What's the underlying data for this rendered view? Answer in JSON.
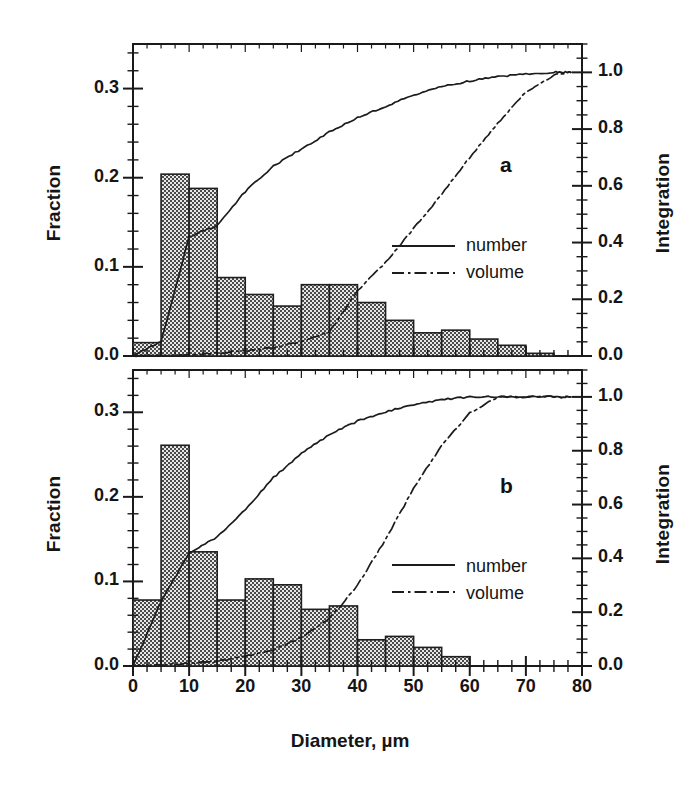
{
  "figure": {
    "xlabel": "Diameter, µm",
    "ylabel_left": "Fraction",
    "ylabel_right": "Integration"
  },
  "axes": {
    "x_ticks": [
      "0",
      "10",
      "20",
      "30",
      "40",
      "50",
      "60",
      "70",
      "80"
    ],
    "y_left_ticks": [
      "0.0",
      "0.1",
      "0.2",
      "0.3"
    ],
    "y_right_ticks": [
      "0.0",
      "0.2",
      "0.4",
      "0.6",
      "0.8",
      "1.0"
    ]
  },
  "legend": {
    "number_label": "number",
    "volume_label": "volume"
  },
  "panels": {
    "a": {
      "letter": "a"
    },
    "b": {
      "letter": "b"
    }
  },
  "chart_data": [
    {
      "type": "bar",
      "panel": "a",
      "title": "",
      "xlabel": "Diameter, µm",
      "ylabel": "Fraction",
      "ylabel_secondary": "Integration",
      "xlim": [
        0,
        80
      ],
      "ylim": [
        0.0,
        0.35
      ],
      "ylim_secondary": [
        0.0,
        1.1
      ],
      "grid": false,
      "legend_position": "center-right",
      "bin_width": 5,
      "bin_edges": [
        0,
        5,
        10,
        15,
        20,
        25,
        30,
        35,
        40,
        45,
        50,
        55,
        60,
        65,
        70,
        75,
        80
      ],
      "categories": [
        "0-5",
        "5-10",
        "10-15",
        "15-20",
        "20-25",
        "25-30",
        "30-35",
        "35-40",
        "40-45",
        "45-50",
        "50-55",
        "55-60",
        "60-65",
        "65-70",
        "70-75",
        "75-80"
      ],
      "values": [
        0.015,
        0.204,
        0.188,
        0.088,
        0.069,
        0.056,
        0.08,
        0.08,
        0.06,
        0.04,
        0.026,
        0.029,
        0.019,
        0.012,
        0.003,
        0.0
      ],
      "series": [
        {
          "name": "number",
          "style": "solid",
          "axis": "secondary",
          "x": [
            0,
            5,
            10,
            15,
            20,
            25,
            30,
            35,
            40,
            45,
            50,
            55,
            60,
            65,
            70,
            75,
            78
          ],
          "values": [
            0.0,
            0.05,
            0.42,
            0.46,
            0.58,
            0.67,
            0.73,
            0.79,
            0.84,
            0.88,
            0.92,
            0.95,
            0.97,
            0.985,
            0.995,
            1.0,
            1.0
          ]
        },
        {
          "name": "volume",
          "style": "dash-dot",
          "axis": "secondary",
          "x": [
            0,
            5,
            10,
            15,
            20,
            25,
            30,
            35,
            40,
            45,
            50,
            55,
            60,
            65,
            70,
            75,
            78
          ],
          "values": [
            0.0,
            0.002,
            0.005,
            0.01,
            0.018,
            0.03,
            0.05,
            0.085,
            0.23,
            0.33,
            0.45,
            0.57,
            0.7,
            0.82,
            0.93,
            0.99,
            1.0
          ]
        }
      ]
    },
    {
      "type": "bar",
      "panel": "b",
      "title": "",
      "xlabel": "Diameter, µm",
      "ylabel": "Fraction",
      "ylabel_secondary": "Integration",
      "xlim": [
        0,
        80
      ],
      "ylim": [
        0.0,
        0.35
      ],
      "ylim_secondary": [
        0.0,
        1.1
      ],
      "grid": false,
      "legend_position": "center-right",
      "bin_width": 5,
      "bin_edges": [
        0,
        5,
        10,
        15,
        20,
        25,
        30,
        35,
        40,
        45,
        50,
        55,
        60,
        65,
        70,
        75,
        80
      ],
      "categories": [
        "0-5",
        "5-10",
        "10-15",
        "15-20",
        "20-25",
        "25-30",
        "30-35",
        "35-40",
        "40-45",
        "45-50",
        "50-55",
        "55-60",
        "60-65",
        "65-70",
        "70-75",
        "75-80"
      ],
      "values": [
        0.078,
        0.261,
        0.135,
        0.078,
        0.103,
        0.096,
        0.067,
        0.071,
        0.031,
        0.035,
        0.022,
        0.011,
        0.0,
        0.0,
        0.0,
        0.0
      ],
      "series": [
        {
          "name": "number",
          "style": "solid",
          "axis": "secondary",
          "x": [
            0,
            5,
            10,
            15,
            20,
            25,
            30,
            35,
            40,
            45,
            50,
            55,
            60,
            65,
            70,
            75,
            78
          ],
          "values": [
            0.0,
            0.24,
            0.42,
            0.48,
            0.58,
            0.7,
            0.79,
            0.86,
            0.91,
            0.945,
            0.97,
            0.99,
            1.0,
            1.0,
            1.0,
            1.0,
            1.0
          ]
        },
        {
          "name": "volume",
          "style": "dash-dot",
          "axis": "secondary",
          "x": [
            0,
            5,
            10,
            15,
            20,
            25,
            30,
            35,
            40,
            45,
            50,
            55,
            60,
            65,
            70,
            75,
            78
          ],
          "values": [
            0.0,
            0.004,
            0.01,
            0.018,
            0.035,
            0.06,
            0.105,
            0.175,
            0.3,
            0.47,
            0.66,
            0.82,
            0.94,
            1.0,
            1.0,
            1.0,
            1.0
          ]
        }
      ]
    }
  ]
}
